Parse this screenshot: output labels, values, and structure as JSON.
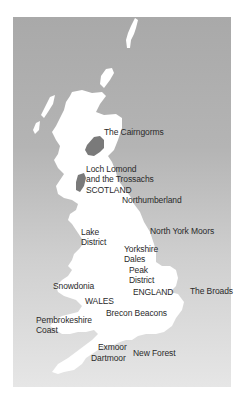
{
  "map": {
    "title": "UK National Parks",
    "colors": {
      "sea_top": "#a9a9a9",
      "sea_bottom": "#e6e6e6",
      "land": "#ffffff",
      "park_highlight": "#7a7a7a",
      "label": "#2a2a2a"
    },
    "countries": [
      {
        "name": "SCOTLAND"
      },
      {
        "name": "ENGLAND"
      },
      {
        "name": "WALES"
      }
    ],
    "parks": [
      {
        "name": "The Cairngorms"
      },
      {
        "name": "Loch Lomond\nand the Trossachs"
      },
      {
        "name": "Northumberland"
      },
      {
        "name": "Lake\nDistrict"
      },
      {
        "name": "North York Moors"
      },
      {
        "name": "Yorkshire\nDales"
      },
      {
        "name": "Peak\nDistrict"
      },
      {
        "name": "The Broads"
      },
      {
        "name": "Snowdonia"
      },
      {
        "name": "Pembrokeshire\nCoast"
      },
      {
        "name": "Brecon Beacons"
      },
      {
        "name": "Exmoor"
      },
      {
        "name": "Dartmoor"
      },
      {
        "name": "New Forest"
      }
    ]
  }
}
